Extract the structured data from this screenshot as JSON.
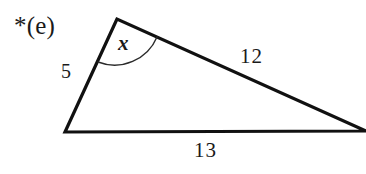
{
  "figure": {
    "part_label": "*(e)",
    "background_color": "#ffffff",
    "stroke_color": "#111111",
    "stroke_width": 3,
    "arc_stroke_width": 1.4,
    "width": 366,
    "height": 174
  },
  "triangle": {
    "vertices": {
      "apex": {
        "x": 117,
        "y": 19
      },
      "bottom_left": {
        "x": 65,
        "y": 132
      },
      "right": {
        "x": 366,
        "y": 131
      }
    },
    "path": "M 117 19 L 65 132 L 366 131 Z"
  },
  "angle_mark": {
    "label": "x",
    "vertex": "apex",
    "arc_path": "M 98 62 A 46 46 0 0 0 157 37",
    "start": {
      "x": 98,
      "y": 62
    },
    "end": {
      "x": 157,
      "y": 37
    },
    "radius": 46
  },
  "side_labels": {
    "left_side": "5",
    "hypotenuse": "12",
    "base": "13"
  }
}
